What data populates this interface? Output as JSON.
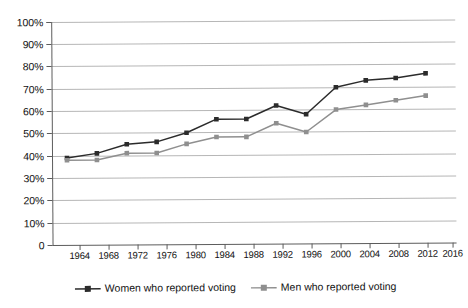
{
  "chart_data": {
    "type": "line",
    "title": "",
    "subtitle": "",
    "xlabel": "",
    "ylabel": "",
    "x": [
      1964,
      1968,
      1972,
      1976,
      1980,
      1984,
      1988,
      1992,
      1996,
      2000,
      2004,
      2008,
      2012
    ],
    "categories": [
      "1964",
      "1968",
      "1972",
      "1976",
      "1980",
      "1984",
      "1988",
      "1992",
      "1996",
      "2000",
      "2004",
      "2008",
      "2012"
    ],
    "xtick_labels": [
      "1964",
      "1968",
      "1972",
      "1976",
      "1980",
      "1984",
      "1988",
      "1992",
      "1996",
      "2000",
      "2004",
      "2008",
      "2016"
    ],
    "xtick_values": [
      1964,
      1968,
      1972,
      1976,
      1980,
      1984,
      1988,
      1992,
      1996,
      2000,
      2004,
      2008,
      2012,
      2016
    ],
    "xlim": [
      1962,
      2016
    ],
    "ylim": [
      0,
      100
    ],
    "ytick_labels": [
      "0",
      "10%",
      "20%",
      "30%",
      "40%",
      "50%",
      "60%",
      "70%",
      "80%",
      "90%",
      "100%"
    ],
    "ytick_values": [
      0,
      10,
      20,
      30,
      40,
      50,
      60,
      70,
      80,
      90,
      100
    ],
    "grid": true,
    "legend_position": "bottom",
    "series": [
      {
        "name": "Women who reported voting",
        "color": "#2b2b2b",
        "marker": "square",
        "values": [
          39,
          41,
          45,
          46,
          50,
          56,
          56,
          62,
          58,
          70,
          73,
          74,
          76
        ]
      },
      {
        "name": "Men who reported voting",
        "color": "#8f8f8f",
        "marker": "square",
        "values": [
          38,
          38,
          41,
          41,
          45,
          48,
          48,
          54,
          50,
          60,
          62,
          64,
          66
        ]
      }
    ]
  },
  "legend": {
    "items": [
      {
        "label": "Women who reported voting",
        "color": "#2b2b2b"
      },
      {
        "label": "Men who reported voting",
        "color": "#8f8f8f"
      }
    ]
  },
  "axes": {
    "y_labels": [
      "100%",
      "90%",
      "80%",
      "70%",
      "60%",
      "50%",
      "40%",
      "30%",
      "20%",
      "10%",
      "0"
    ],
    "x_labels": [
      "1964",
      "1968",
      "1972",
      "1976",
      "1980",
      "1984",
      "1988",
      "1992",
      "1996",
      "2000",
      "2004",
      "2008",
      "2012",
      "2016"
    ]
  },
  "caption": {
    "text": ""
  }
}
